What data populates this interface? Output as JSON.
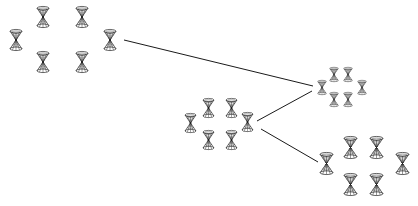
{
  "diagram": {
    "background": "#ffffff",
    "stroke_color": "#1a1a1a",
    "icon": "double-cone-icon",
    "clusters": [
      {
        "id": "cluster-1",
        "icon_w": 14,
        "icon_h": 22,
        "nodes": [
          [
            16,
            40
          ],
          [
            43,
            17
          ],
          [
            82,
            17
          ],
          [
            110,
            40
          ],
          [
            43,
            62
          ],
          [
            82,
            62
          ]
        ]
      },
      {
        "id": "cluster-2",
        "icon_w": 10,
        "icon_h": 15,
        "nodes": [
          [
            322,
            87
          ],
          [
            334,
            74
          ],
          [
            348,
            74
          ],
          [
            362,
            87
          ],
          [
            334,
            99
          ],
          [
            348,
            99
          ]
        ]
      },
      {
        "id": "cluster-3",
        "icon_w": 13,
        "icon_h": 20,
        "nodes": [
          [
            190,
            123
          ],
          [
            208,
            108
          ],
          [
            231,
            108
          ],
          [
            247,
            122
          ],
          [
            208,
            140
          ],
          [
            231,
            140
          ]
        ]
      },
      {
        "id": "cluster-4",
        "icon_w": 15,
        "icon_h": 23,
        "nodes": [
          [
            326,
            163
          ],
          [
            350,
            147
          ],
          [
            376,
            147
          ],
          [
            402,
            163
          ],
          [
            350,
            184
          ],
          [
            376,
            184
          ]
        ]
      }
    ],
    "links": [
      {
        "from": "cluster-1",
        "to": "cluster-2",
        "x1": 124,
        "y1": 40,
        "x2": 313,
        "y2": 86
      },
      {
        "from": "cluster-3",
        "to": "cluster-2",
        "x1": 257,
        "y1": 121,
        "x2": 312,
        "y2": 91
      },
      {
        "from": "cluster-3",
        "to": "cluster-4",
        "x1": 261,
        "y1": 129,
        "x2": 318,
        "y2": 162
      }
    ]
  }
}
